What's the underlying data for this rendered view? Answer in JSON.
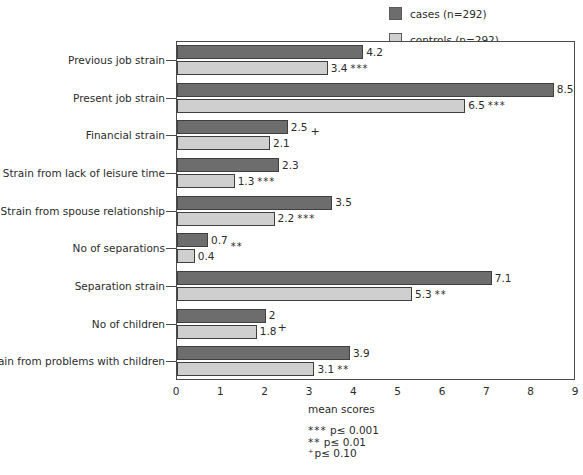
{
  "legend": {
    "position": "top-right",
    "items": [
      {
        "label": "cases (n=292)",
        "color": "#6d6d6d",
        "key": "cases"
      },
      {
        "label": "controls (n=292)",
        "color": "#cfcfcf",
        "key": "controls"
      }
    ]
  },
  "chart_data": {
    "type": "bar",
    "orientation": "horizontal",
    "title": "",
    "xlabel": "mean scores",
    "ylabel": "",
    "xlim": [
      0,
      9
    ],
    "xticks": [
      "0",
      "1",
      "2",
      "3",
      "4",
      "5",
      "6",
      "7",
      "8",
      "9"
    ],
    "grid": false,
    "categories": [
      "Previous job strain",
      "Present job strain",
      "Financial strain",
      "Strain from lack of leisure time",
      "Strain from spouse relationship",
      "No of separations",
      "Separation strain",
      "No of children",
      "Strain from problems with children"
    ],
    "series": [
      {
        "name": "cases (n=292)",
        "color": "#6d6d6d",
        "values": [
          4.2,
          8.5,
          2.5,
          2.3,
          3.5,
          0.7,
          7.1,
          2,
          3.9
        ],
        "labels": [
          "4.2",
          "8.5",
          "2.5",
          "2.3",
          "3.5",
          "0.7",
          "7.1",
          "2",
          "3.9"
        ],
        "significance": [
          "",
          "",
          "",
          "",
          "",
          "",
          "",
          "",
          ""
        ]
      },
      {
        "name": "controls (n=292)",
        "color": "#cfcfcf",
        "values": [
          3.4,
          6.5,
          2.1,
          1.3,
          2.2,
          0.4,
          5.3,
          1.8,
          3.1
        ],
        "labels": [
          "3.4",
          "6.5",
          "2.1",
          "1.3",
          "2.2",
          "0.4",
          "5.3",
          "1.8",
          "3.1"
        ],
        "significance": [
          "***",
          "***",
          "",
          "***",
          "***",
          "",
          "**",
          "",
          "**"
        ]
      }
    ],
    "extra_markers": [
      {
        "category": "Financial strain",
        "marker": "+",
        "anchor": "cases-below"
      },
      {
        "category": "No of separations",
        "marker": "**",
        "anchor": "cases-below"
      },
      {
        "category": "No of children",
        "marker": "+",
        "anchor": "controls-right"
      }
    ]
  },
  "footnotes": [
    {
      "stars": "***",
      "text": " p≤ 0.001"
    },
    {
      "stars": "**",
      "text": " p≤ 0.01"
    },
    {
      "stars": "⁺",
      "text": "p≤ 0.10"
    }
  ],
  "caption": ""
}
